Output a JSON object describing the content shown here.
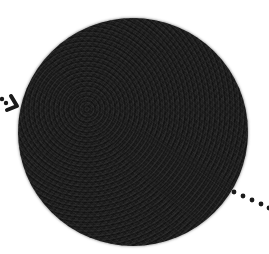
{
  "figure": {
    "colors": {
      "background": "#ffffff",
      "sphere_core": "#1e1e1e",
      "sphere_limb": "#6e6e6e",
      "markers": "#1a1a1a"
    },
    "icons": {
      "incoming_arrow": "arrow-right-icon",
      "outgoing_path": "dotted-line"
    }
  }
}
